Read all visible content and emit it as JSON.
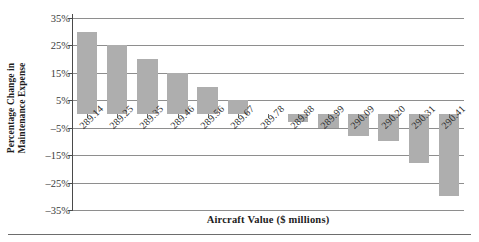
{
  "chart_data": {
    "type": "bar",
    "title": "",
    "xlabel": "Aircraft Value ($ millions)",
    "ylabel_line1": "Percentage Change in",
    "ylabel_line2": "Maintenance Expense",
    "categories": [
      "289.14",
      "289.25",
      "289.35",
      "289.46",
      "289.56",
      "289.67",
      "289.78",
      "289.88",
      "289.99",
      "290.09",
      "290.20",
      "290.31",
      "290.41"
    ],
    "values": [
      30,
      25,
      20,
      15,
      10,
      5,
      0,
      -3,
      -5,
      -8,
      -10,
      -18,
      -30
    ],
    "value_labels": [
      "30%",
      "25%",
      "20%",
      "15%",
      "10%",
      "5%",
      "0%",
      "-3%",
      "-5%",
      "-8%",
      "-10%",
      "-18%",
      "-30%"
    ],
    "ylim": [
      -35,
      35
    ],
    "ytick_values": [
      35,
      25,
      15,
      5,
      -5,
      -15,
      -25,
      -35
    ],
    "ytick_labels": [
      "35%",
      "25%",
      "15%",
      "5%",
      "–35%",
      "–15%",
      "–25%",
      "–35%"
    ],
    "ytick_labels_display": [
      "35%",
      "25%",
      "15%",
      "5%",
      "–5%",
      "–15%",
      "–25%",
      "–35%"
    ],
    "grid": true,
    "grid_axis": "y",
    "legend": "none",
    "bar_color": "#aeaeae",
    "axis_color": "#4a4a4a",
    "grid_color": "#8e8e8e",
    "xtick_rotation": -45
  }
}
